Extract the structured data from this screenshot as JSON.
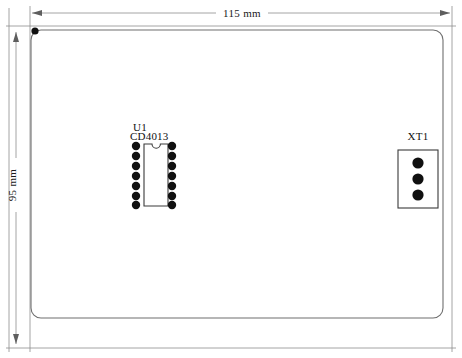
{
  "drawing": {
    "title": "PCB component layout drawing",
    "background_color": "#ffffff",
    "outline_color": "#6f6f6f",
    "dimension_color": "#8d8d8d",
    "pad_color": "#101010"
  },
  "dimensions": {
    "width": {
      "label": "115 mm",
      "value": 115,
      "unit": "mm",
      "orientation": "horizontal"
    },
    "height": {
      "label": "95 mm",
      "value": 95,
      "unit": "mm",
      "orientation": "vertical"
    }
  },
  "board": {
    "name": "pcb-outline",
    "shape": "rounded-rectangle",
    "pin1_marker": {
      "name": "pin-1-marker-dot",
      "position": "top-left"
    }
  },
  "components": [
    {
      "id": "U1",
      "designator": "U1",
      "part_number": "CD4013",
      "package": "DIP-14",
      "pin_count": 14,
      "pins_per_side": 7,
      "has_notch": true,
      "notch_position": "top"
    },
    {
      "id": "XT1",
      "designator": "XT1",
      "part_number": "",
      "package": "terminal-block",
      "pin_count": 3,
      "pins_per_side": 3,
      "has_notch": false,
      "notch_position": ""
    }
  ],
  "labels": {
    "u1_designator": "U1",
    "u1_part": "CD4013",
    "xt1_designator": "XT1"
  }
}
